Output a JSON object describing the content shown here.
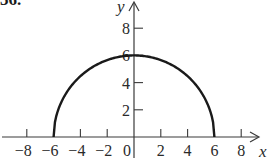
{
  "problem": {
    "number_label": "36."
  },
  "colors": {
    "axis": "#3a3a3a",
    "curve": "#1a1a1a",
    "text": "#2a2a2a",
    "background": "#ffffff"
  },
  "chart_data": {
    "type": "line",
    "title": "",
    "xlabel": "x",
    "ylabel": "y",
    "xlim": [
      -9,
      10
    ],
    "ylim": [
      0,
      10
    ],
    "grid": false,
    "legend": null,
    "x_ticks": [
      -8,
      -6,
      -4,
      -2,
      0,
      2,
      4,
      6,
      8
    ],
    "x_tick_labels": [
      "−8",
      "−6",
      "−4",
      "−2",
      "0",
      "2",
      "4",
      "6",
      "8"
    ],
    "y_ticks": [
      2,
      4,
      6,
      8
    ],
    "y_tick_labels": [
      "2",
      "4",
      "6",
      "8"
    ],
    "series": [
      {
        "name": "semicircle",
        "equation": "y = sqrt(36 - x^2)",
        "x": [
          -6,
          -5,
          -4,
          -3,
          -2,
          -1,
          0,
          1,
          2,
          3,
          4,
          5,
          6
        ],
        "values": [
          0,
          3.32,
          4.47,
          5.2,
          5.66,
          5.92,
          6,
          5.92,
          5.66,
          5.2,
          4.47,
          3.32,
          0
        ]
      }
    ]
  }
}
